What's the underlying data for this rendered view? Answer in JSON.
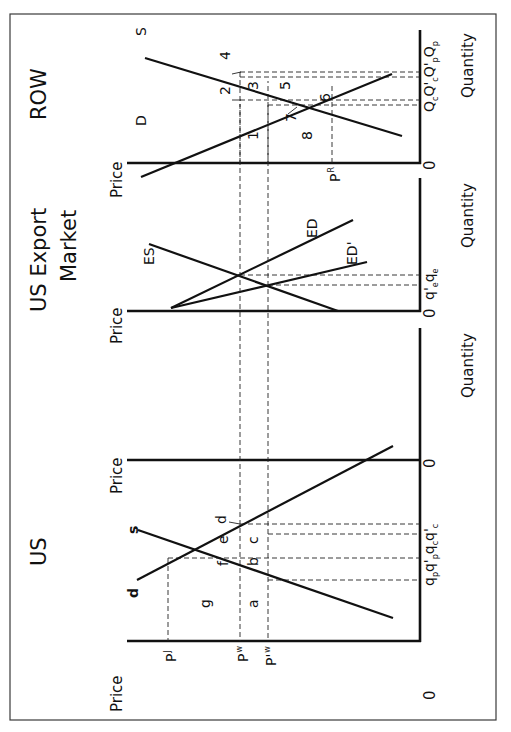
{
  "orientation": "rotated 90 degrees counter-clockwise",
  "panels": {
    "us": {
      "title": "US",
      "price_axis_label": "Price",
      "quantity_axis_label": "Quantity",
      "origin_label": "0",
      "curves": {
        "demand": "d",
        "supply": "s"
      },
      "price_labels": {
        "pj": "P",
        "pj_sub": "J",
        "pw": "P",
        "pw_sub": "w",
        "pw_prime": "P'",
        "pw_prime_sub": "w"
      },
      "quantity_labels": [
        "q",
        "p",
        "q'",
        "p",
        "q",
        "c",
        "q'",
        "c"
      ],
      "quantity_label_text": "qp q'p qc q'c",
      "area_labels": [
        "a",
        "b",
        "c",
        "d",
        "e",
        "f",
        "g"
      ]
    },
    "export_market": {
      "title_line1": "US Export",
      "title_line2": "Market",
      "price_axis_label": "Price",
      "quantity_axis_label": "Quantity",
      "origin_label": "0",
      "curves": {
        "excess_supply": "ES",
        "excess_demand": "ED",
        "excess_demand_shifted": "ED'"
      },
      "quantity_label_text": "q'e qe"
    },
    "row": {
      "title": "ROW",
      "price_axis_label": "Price",
      "quantity_axis_label": "Quantity",
      "origin_label": "0",
      "curves": {
        "demand": "D",
        "supply": "S"
      },
      "price_labels": {
        "pr": "P",
        "pr_sub": "R"
      },
      "quantity_label_text": "Qc Q'c Q'p Qp",
      "area_labels": [
        "1",
        "2",
        "3",
        "4",
        "5",
        "6",
        "7",
        "8"
      ]
    }
  }
}
